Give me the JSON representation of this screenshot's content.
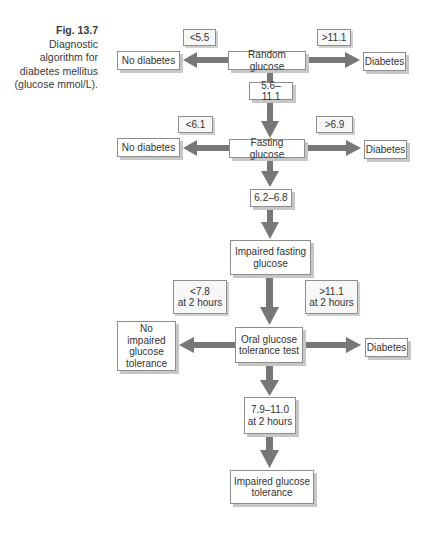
{
  "caption": {
    "figure_label": "Fig. 13.7",
    "text_lines": [
      "Diagnostic",
      "algorithm for",
      "diabetes mellitus",
      "(glucose mmol/L)."
    ]
  },
  "colors": {
    "arrow": "#777777",
    "box_border": "#8e8e8e",
    "box_shadow": "#c7c7c7",
    "text": "#333333"
  },
  "row1": {
    "center": "Random glucose",
    "left_condition": "<5.5",
    "left_outcome": "No diabetes",
    "right_condition": ">11.1",
    "right_outcome": "Diabetes",
    "down_condition": "5.6–11.1"
  },
  "row2": {
    "center": "Fasting glucose",
    "left_condition": "<6.1",
    "left_outcome": "No diabetes",
    "right_condition": ">6.9",
    "right_outcome": "Diabetes",
    "down_condition": "6.2–6.8"
  },
  "row3": {
    "intermediate": "Impaired fasting\nglucose",
    "center": "Oral glucose\ntolerance test",
    "left_condition": "<7.8\nat 2 hours",
    "left_outcome": "No impaired\nglucose\ntolerance",
    "right_condition": ">11.1\nat 2 hours",
    "right_outcome": "Diabetes",
    "down_condition": "7.9–11.0\nat 2 hours",
    "final_outcome": "Impaired glucose\ntolerance"
  }
}
